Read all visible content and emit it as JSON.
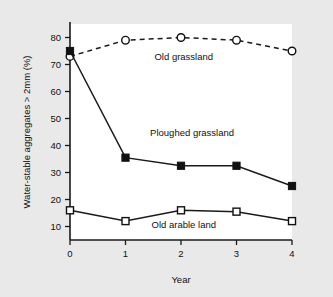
{
  "chart_data": {
    "type": "line",
    "title": "",
    "xlabel": "Year",
    "ylabel": "Water-stable aggregates > 2mm (%)",
    "xlim": [
      0,
      4
    ],
    "ylim": [
      5,
      85
    ],
    "grid": false,
    "legend_position": "inline-annotations",
    "x": [
      0,
      1,
      2,
      3,
      4
    ],
    "xticks": [
      "0",
      "1",
      "2",
      "3",
      "4"
    ],
    "yticks": [
      "10",
      "20",
      "30",
      "40",
      "50",
      "60",
      "70",
      "80"
    ],
    "series": [
      {
        "name": "Old grassland",
        "marker": "open-circle",
        "linestyle": "dashed",
        "values": [
          73,
          79,
          80,
          79,
          75
        ],
        "label_x": 2.05,
        "label_y": 71.5
      },
      {
        "name": "Ploughed grassland",
        "marker": "filled-square",
        "linestyle": "solid",
        "values": [
          75,
          35.5,
          32.5,
          32.5,
          25
        ],
        "label_x": 2.2,
        "label_y": 43.5
      },
      {
        "name": "Old arable land",
        "marker": "open-square",
        "linestyle": "solid",
        "values": [
          16,
          12,
          16,
          15.5,
          12
        ],
        "label_x": 2.05,
        "label_y": 9.5
      }
    ]
  },
  "figure": {
    "background_color": "#e9e9e9",
    "plot_background_color": "#ffffff",
    "ink_color": "#111111"
  }
}
